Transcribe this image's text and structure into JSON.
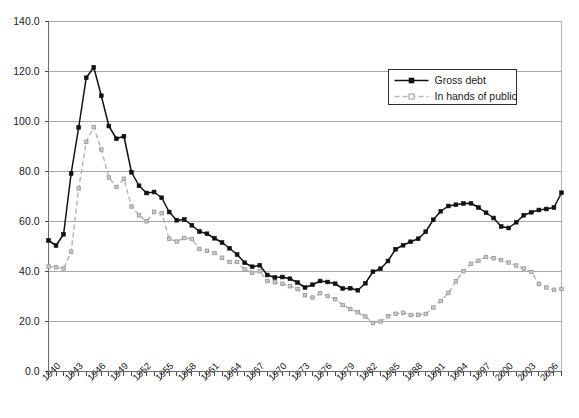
{
  "chart_data": {
    "type": "line",
    "title": "",
    "xlabel": "",
    "ylabel": "",
    "ylim": [
      0.0,
      140.0
    ],
    "xlim": [
      1940,
      2008
    ],
    "grid": true,
    "legend_position": "top-right",
    "ytick_labels": [
      "0.0",
      "20.0",
      "40.0",
      "60.0",
      "80.0",
      "100.0",
      "120.0",
      "140.0"
    ],
    "ytick_values": [
      0,
      20,
      40,
      60,
      80,
      100,
      120,
      140
    ],
    "xtick_labels": [
      "1940",
      "1943",
      "1946",
      "1949",
      "1952",
      "1955",
      "1958",
      "1961",
      "1964",
      "1967",
      "1970",
      "1973",
      "1976",
      "1979",
      "1982",
      "1985",
      "1988",
      "1991",
      "1994",
      "1997",
      "2000",
      "2003",
      "2006"
    ],
    "x": [
      1940,
      1941,
      1942,
      1943,
      1944,
      1945,
      1946,
      1947,
      1948,
      1949,
      1950,
      1951,
      1952,
      1953,
      1954,
      1955,
      1956,
      1957,
      1958,
      1959,
      1960,
      1961,
      1962,
      1963,
      1964,
      1965,
      1966,
      1967,
      1968,
      1969,
      1970,
      1971,
      1972,
      1973,
      1974,
      1975,
      1976,
      1977,
      1978,
      1979,
      1980,
      1981,
      1982,
      1983,
      1984,
      1985,
      1986,
      1987,
      1988,
      1989,
      1990,
      1991,
      1992,
      1993,
      1994,
      1995,
      1996,
      1997,
      1998,
      1999,
      2000,
      2001,
      2002,
      2003,
      2004,
      2005,
      2006,
      2007,
      2008
    ],
    "series": [
      {
        "name": "Gross debt",
        "color": "#111111",
        "style": "solid",
        "marker": "filled-square",
        "values": [
          52.4,
          50.4,
          54.9,
          79.2,
          97.6,
          117.5,
          121.7,
          110.3,
          98.2,
          93.1,
          94.1,
          79.7,
          74.3,
          71.4,
          71.8,
          69.5,
          63.8,
          60.5,
          60.8,
          58.5,
          56.0,
          55.1,
          53.3,
          51.6,
          49.3,
          46.8,
          43.5,
          41.9,
          42.5,
          38.6,
          37.6,
          37.8,
          37.1,
          35.6,
          33.6,
          34.7,
          36.2,
          35.8,
          35.1,
          33.2,
          33.3,
          32.5,
          35.3,
          39.9,
          41.1,
          44.2,
          48.9,
          50.5,
          51.9,
          53.1,
          55.9,
          60.7,
          64.1,
          66.2,
          66.7,
          67.2,
          67.3,
          65.6,
          63.5,
          61.4,
          58.0,
          57.4,
          59.7,
          62.5,
          63.7,
          64.6,
          65.0,
          65.6,
          71.5
        ]
      },
      {
        "name": "In hands of public",
        "color": "#b3b3b3",
        "style": "dashed",
        "marker": "open-square",
        "values": [
          42.0,
          41.7,
          41.2,
          47.9,
          73.2,
          91.9,
          97.8,
          88.8,
          77.6,
          73.8,
          77.1,
          66.0,
          62.5,
          60.1,
          63.9,
          63.3,
          53.1,
          52.0,
          53.4,
          53.0,
          49.0,
          48.3,
          47.4,
          45.5,
          43.8,
          43.8,
          40.8,
          39.5,
          40.1,
          36.2,
          35.7,
          35.1,
          34.1,
          33.0,
          30.5,
          29.6,
          31.3,
          30.2,
          28.9,
          26.6,
          25.0,
          23.7,
          22.0,
          19.4,
          20.0,
          22.1,
          23.1,
          23.5,
          22.6,
          22.7,
          23.0,
          25.6,
          28.2,
          31.4,
          36.1,
          40.1,
          43.1,
          44.3,
          45.8,
          45.3,
          44.6,
          43.6,
          42.4,
          41.2,
          39.8,
          35.1,
          33.6,
          32.7,
          33.0
        ]
      }
    ]
  },
  "legend": {
    "entries": [
      {
        "label": "Gross debt",
        "marker": "filled-square-icon",
        "style": "solid"
      },
      {
        "label": "In hands of public",
        "marker": "open-square-icon",
        "style": "dashed"
      }
    ]
  }
}
